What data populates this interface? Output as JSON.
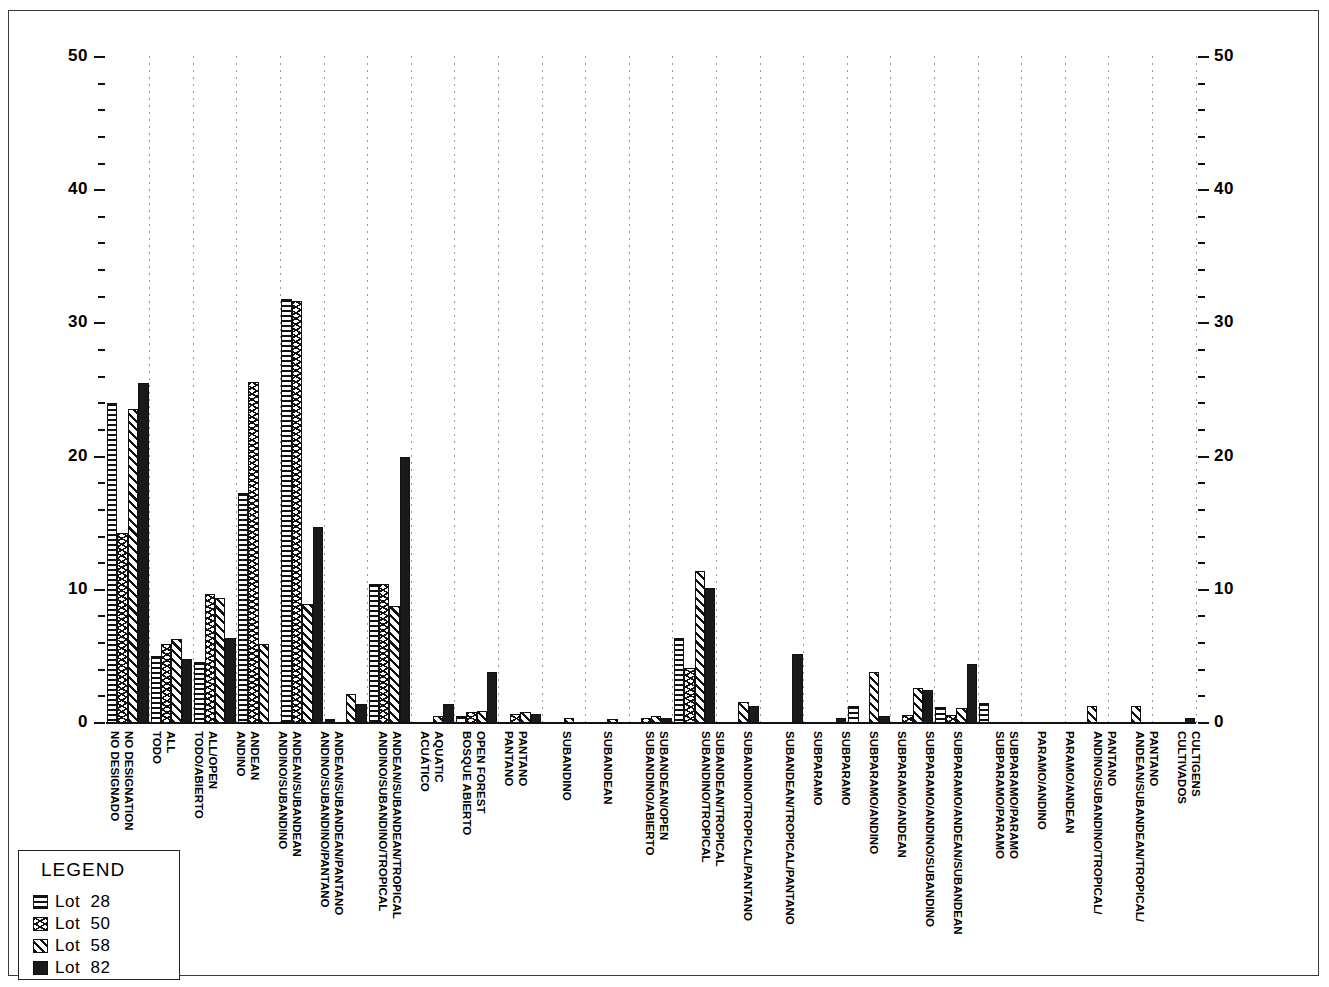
{
  "legend": {
    "title": "LEGEND",
    "entries": [
      {
        "label": "Lot  28",
        "pattern": "horizontal-lines"
      },
      {
        "label": "Lot  50",
        "pattern": "chevron"
      },
      {
        "label": "Lot  58",
        "pattern": "diagonal-lines"
      },
      {
        "label": "Lot  82",
        "pattern": "solid-black"
      }
    ]
  },
  "chart_data": {
    "type": "bar",
    "title": "",
    "xlabel": "",
    "ylabel": "",
    "ylim": [
      0,
      50
    ],
    "y_ticks": [
      0,
      10,
      20,
      30,
      40,
      50
    ],
    "y_minor_step": 2,
    "grid": "dotted-vertical-separators",
    "legend_position": "bottom-left",
    "dual_axis": true,
    "left_axis_ticks": [
      "0",
      "10",
      "20",
      "30",
      "40",
      "50"
    ],
    "right_axis_ticks": [
      "0",
      "10",
      "20",
      "30",
      "40",
      "50"
    ],
    "series": [
      {
        "name": "Lot 28",
        "pattern": "horizontal-lines",
        "values": [
          24,
          5,
          4.6,
          17.3,
          31.8,
          0.3,
          10.4,
          0,
          0.5,
          0,
          0,
          0,
          0,
          6.4,
          0,
          0,
          0,
          1.3,
          0,
          1.2,
          1.5,
          0,
          0,
          0,
          0
        ]
      },
      {
        "name": "Lot 50",
        "pattern": "chevron",
        "values": [
          14.3,
          5.9,
          9.7,
          25.6,
          31.7,
          0,
          10.4,
          0,
          0,
          0.8,
          0,
          0,
          0,
          4.1,
          0,
          0,
          0,
          0,
          0.6,
          2.4,
          1.1,
          0,
          0,
          0,
          0
        ]
      },
      {
        "name": "Lot 58",
        "pattern": "diagonal-lines",
        "values": [
          23.6,
          6.3,
          9.4,
          5.9,
          8.9,
          2.2,
          8.8,
          0,
          0,
          0.8,
          0.5,
          0.3,
          0.4,
          11.4,
          1.6,
          0,
          0,
          3.8,
          2.6,
          1.1,
          1.5,
          1.3,
          1.3,
          0,
          0
        ]
      },
      {
        "name": "Lot 82",
        "pattern": "solid-black",
        "values": [
          25.5,
          4.8,
          6.4,
          0,
          14.7,
          1.4,
          20.0,
          1.4,
          3.8,
          0.7,
          0,
          0,
          0.4,
          10.1,
          1.3,
          5.2,
          0,
          0,
          0.6,
          4.4,
          0,
          0,
          0,
          0,
          0.3
        ]
      }
    ],
    "categories": [
      {
        "english": "NO  DESIGNATION",
        "spanish": "NO  DESIGNADO"
      },
      {
        "english": "ALL",
        "spanish": "TODO"
      },
      {
        "english": "ALL/OPEN",
        "spanish": "TODO/ABIERTO"
      },
      {
        "english": "ANDEAN",
        "spanish": "ANDINO"
      },
      {
        "english": "ANDEAN/SUBANDEAN",
        "spanish": "ANDINO/SUBANDINO"
      },
      {
        "english": "ANDEAN/SUBANDEAN/PANTANO",
        "spanish": "ANDINO/SUBANDINO/PANTANO"
      },
      {
        "english": "ANDEAN/SUBANDEAN/TROPICAL",
        "spanish": "ANDINO/SUBANDINO/TROPICAL"
      },
      {
        "english": "AQUATIC",
        "spanish": "ACUÁTICO"
      },
      {
        "english": "OPEN  FOREST",
        "spanish": "BOSQUE  ABIERTO"
      },
      {
        "english": "PANTANO",
        "spanish": "PANTANO"
      },
      {
        "english": "SUBANDEAN",
        "spanish": "SUBANDINO"
      },
      {
        "english": "SUBANDEAN/OPEN",
        "spanish": "SUBANDINO/ABIERTO"
      },
      {
        "english": "SUBANDEAN/TROPICAL",
        "spanish": "SUBANDINO/TROPICAL"
      },
      {
        "english": "SUBANDEAN/TROPICAL",
        "spanish": "SUBANDINO/TROPICAL"
      },
      {
        "english": "SUBANDEAN/TROPICAL/PANTANO",
        "spanish": "SUBANDINO/TROPICAL/PANTANO"
      },
      {
        "english": "SUBANDEAN/TROPICAL/PANTANO",
        "spanish": "SUBANDINO/TROPICAL/PANTANO"
      },
      {
        "english": "SUBPARAMO",
        "spanish": "SUBPARAMO"
      },
      {
        "english": "SUBPARAMO/ANDEAN",
        "spanish": "SUBPARAMO/ANDINO"
      },
      {
        "english": "SUBPARAMO/ANDEAN",
        "spanish": "SUBPARAMO/ANDINO"
      },
      {
        "english": "SUBPARAMO/ANDEAN/SUBANDEAN",
        "spanish": "SUBPARAMO/ANDINO/SUBANDINO"
      },
      {
        "english": "SUBPARAMO/ANDEAN/SUBANDEAN",
        "spanish": "SUBPARAMO/ANDINO/SUBANDINO"
      },
      {
        "english": "SUBPARAMO/PARAMO",
        "spanish": "SUBPARAMO/PARAMO"
      },
      {
        "english": "PARAMO/ANDEAN",
        "spanish": "PARAMO/ANDINO"
      },
      {
        "english": "ANDEAN/SUBANDEAN/TROPICAL/ PANTANO",
        "spanish": "ANDINO/SUBANDINO/TROPICAL/ PANTANO"
      },
      {
        "english": "CULTIGENS",
        "spanish": "CULTIVADOS"
      }
    ],
    "axis_labels_order": [
      "NO  DESIGNADO",
      "NO  DESIGNATION",
      "TODO",
      "ALL",
      "TODO/ABIERTO",
      "ALL/OPEN",
      "ANDINO",
      "ANDEAN",
      "ANDINO/SUBANDINO",
      "ANDEAN/SUBANDEAN",
      "ANDINO/SUBANDINO/PANTANO",
      "ANDEAN/SUBANDEAN/PANTANO",
      "ANDINO/SUBANDINO/TROPICAL",
      "ANDEAN/SUBANDEAN/TROPICAL",
      "ACUÁTICO",
      "AQUATIC",
      "BOSQUE  ABIERTO",
      "OPEN  FOREST",
      "PANTANO",
      "PANTANO",
      "SUBANDINO",
      "SUBANDEAN",
      "SUBANDINO/ABIERTO",
      "SUBANDEAN/OPEN",
      "SUBANDINO/TROPICAL",
      "SUBANDEAN/TROPICAL",
      "SUBANDINO/TROPICAL/PANTANO",
      "SUBANDEAN/TROPICAL/PANTANO",
      "SUBPARAMO",
      "SUBPARAMO",
      "SUBPARAMO/ANDINO",
      "SUBPARAMO/ANDEAN",
      "SUBPARAMO/ANDINO/SUBANDINO",
      "SUBPARAMO/ANDEAN/SUBANDEAN",
      "SUBPARAMO/PARAMO",
      "SUBPARAMO/PARAMO",
      "PARAMO/ANDINO",
      "PARAMO/ANDEAN",
      "ANDINO/SUBANDINO/TROPICAL/ PANTANO",
      "ANDEAN/SUBANDEAN/TROPICAL/ PANTANO",
      "CULTIVADOS",
      "CULTIGENS"
    ]
  },
  "xaxis": {
    "labels": [
      {
        "text": "NO  DESIGNADO",
        "x": 121,
        "y": 731
      },
      {
        "text": "NO  DESIGNATION",
        "x": 135,
        "y": 731
      },
      {
        "text": "TODO",
        "x": 163,
        "y": 731
      },
      {
        "text": "ALL",
        "x": 177,
        "y": 731
      },
      {
        "text": "TODO/ABIERTO",
        "x": 205,
        "y": 731
      },
      {
        "text": "ALL/OPEN",
        "x": 219,
        "y": 731
      },
      {
        "text": "ANDINO",
        "x": 247,
        "y": 731
      },
      {
        "text": "ANDEAN",
        "x": 261,
        "y": 731
      },
      {
        "text": "ANDINO/SUBANDINO",
        "x": 289,
        "y": 731
      },
      {
        "text": "ANDEAN/SUBANDEAN",
        "x": 303,
        "y": 731
      },
      {
        "text": "ANDINO/SUBANDINO/PANTANO",
        "x": 331,
        "y": 731
      },
      {
        "text": "ANDEAN/SUBANDEAN/PANTANO",
        "x": 345,
        "y": 731
      },
      {
        "text": "ANDINO/SUBANDINO/TROPICAL",
        "x": 389,
        "y": 731
      },
      {
        "text": "ANDEAN/SUBANDEAN/TROPICAL",
        "x": 403,
        "y": 731
      },
      {
        "text": "ACUÁTICO",
        "x": 431,
        "y": 731
      },
      {
        "text": "AQUATIC",
        "x": 445,
        "y": 731
      },
      {
        "text": "BOSQUE  ABIERTO",
        "x": 473,
        "y": 731
      },
      {
        "text": "OPEN  FOREST",
        "x": 487,
        "y": 731
      },
      {
        "text": "PANTANO",
        "x": 515,
        "y": 731
      },
      {
        "text": "PANTANO",
        "x": 529,
        "y": 731
      },
      {
        "text": "SUBANDINO",
        "x": 573,
        "y": 731
      },
      {
        "text": "SUBANDEAN",
        "x": 614,
        "y": 731
      },
      {
        "text": "SUBANDINO/ABIERTO",
        "x": 656,
        "y": 731
      },
      {
        "text": "SUBANDEAN/OPEN",
        "x": 670,
        "y": 731
      },
      {
        "text": "SUBANDINO/TROPICAL",
        "x": 712,
        "y": 731
      },
      {
        "text": "SUBANDEAN/TROPICAL",
        "x": 726,
        "y": 731
      },
      {
        "text": "SUBANDINO/TROPICAL/PANTANO",
        "x": 754,
        "y": 731
      },
      {
        "text": "SUBANDEAN/TROPICAL/PANTANO",
        "x": 796,
        "y": 731
      },
      {
        "text": "SUBPARAMO",
        "x": 824,
        "y": 731
      },
      {
        "text": "SUBPARAMO",
        "x": 852,
        "y": 731
      },
      {
        "text": "SUBPARAMO/ANDINO",
        "x": 880,
        "y": 731
      },
      {
        "text": "SUBPARAMO/ANDEAN",
        "x": 908,
        "y": 731
      },
      {
        "text": "SUBPARAMO/ANDINO/SUBANDINO",
        "x": 936,
        "y": 731
      },
      {
        "text": "SUBPARAMO/ANDEAN/SUBANDEAN",
        "x": 964,
        "y": 731
      },
      {
        "text": "SUBPARAMO/PARAMO",
        "x": 1006,
        "y": 731
      },
      {
        "text": "SUBPARAMO/PARAMO",
        "x": 1020,
        "y": 731
      },
      {
        "text": "PARAMO/ANDINO",
        "x": 1048,
        "y": 731
      },
      {
        "text": "PARAMO/ANDEAN",
        "x": 1076,
        "y": 731
      },
      {
        "text": "ANDINO/SUBANDINO/TROPICAL/",
        "x": 1104,
        "y": 731
      },
      {
        "text": "PANTANO",
        "x": 1118,
        "y": 731
      },
      {
        "text": "ANDEAN/SUBANDEAN/TROPICAL/",
        "x": 1146,
        "y": 731
      },
      {
        "text": "PANTANO",
        "x": 1160,
        "y": 731
      },
      {
        "text": "CULTIVADOS",
        "x": 1188,
        "y": 731
      },
      {
        "text": "CULTIGENS",
        "x": 1202,
        "y": 731
      }
    ]
  },
  "yaxis": {
    "left_labels": [
      {
        "text": "50",
        "v": 50
      },
      {
        "text": "40",
        "v": 40
      },
      {
        "text": "30",
        "v": 30
      },
      {
        "text": "20",
        "v": 20
      },
      {
        "text": "10",
        "v": 10
      },
      {
        "text": "0",
        "v": 0
      }
    ],
    "right_labels": [
      {
        "text": "50",
        "v": 50
      },
      {
        "text": "40",
        "v": 40
      },
      {
        "text": "30",
        "v": 30
      },
      {
        "text": "20",
        "v": 20
      },
      {
        "text": "10",
        "v": 10
      },
      {
        "text": "0",
        "v": 0
      }
    ]
  },
  "bars": [
    {
      "g": 0,
      "s": 0,
      "v": 24.0
    },
    {
      "g": 0,
      "s": 1,
      "v": 14.3
    },
    {
      "g": 0,
      "s": 2,
      "v": 23.6
    },
    {
      "g": 0,
      "s": 3,
      "v": 25.5
    },
    {
      "g": 1,
      "s": 0,
      "v": 5.0
    },
    {
      "g": 1,
      "s": 1,
      "v": 5.9
    },
    {
      "g": 1,
      "s": 2,
      "v": 6.3
    },
    {
      "g": 1,
      "s": 3,
      "v": 4.8
    },
    {
      "g": 2,
      "s": 0,
      "v": 4.6
    },
    {
      "g": 2,
      "s": 1,
      "v": 9.7
    },
    {
      "g": 2,
      "s": 2,
      "v": 9.4
    },
    {
      "g": 2,
      "s": 3,
      "v": 6.4
    },
    {
      "g": 3,
      "s": 0,
      "v": 17.3
    },
    {
      "g": 3,
      "s": 1,
      "v": 25.6
    },
    {
      "g": 3,
      "s": 2,
      "v": 5.9
    },
    {
      "g": 3,
      "s": 3,
      "v": 0
    },
    {
      "g": 4,
      "s": 0,
      "v": 31.8
    },
    {
      "g": 4,
      "s": 1,
      "v": 31.7
    },
    {
      "g": 4,
      "s": 2,
      "v": 8.9
    },
    {
      "g": 4,
      "s": 3,
      "v": 14.7
    },
    {
      "g": 5,
      "s": 0,
      "v": 0.3
    },
    {
      "g": 5,
      "s": 1,
      "v": 0
    },
    {
      "g": 5,
      "s": 2,
      "v": 2.2
    },
    {
      "g": 5,
      "s": 3,
      "v": 1.4
    },
    {
      "g": 6,
      "s": 0,
      "v": 10.4
    },
    {
      "g": 6,
      "s": 1,
      "v": 10.4
    },
    {
      "g": 6,
      "s": 2,
      "v": 8.8
    },
    {
      "g": 6,
      "s": 3,
      "v": 20.0
    },
    {
      "g": 7,
      "s": 0,
      "v": 0
    },
    {
      "g": 7,
      "s": 1,
      "v": 0
    },
    {
      "g": 7,
      "s": 2,
      "v": 0.5
    },
    {
      "g": 7,
      "s": 3,
      "v": 1.4
    },
    {
      "g": 8,
      "s": 0,
      "v": 0.5
    },
    {
      "g": 8,
      "s": 1,
      "v": 0.8
    },
    {
      "g": 8,
      "s": 2,
      "v": 0.9
    },
    {
      "g": 8,
      "s": 3,
      "v": 3.8
    },
    {
      "g": 9,
      "s": 0,
      "v": 0
    },
    {
      "g": 9,
      "s": 1,
      "v": 0.7
    },
    {
      "g": 9,
      "s": 2,
      "v": 0.8
    },
    {
      "g": 9,
      "s": 3,
      "v": 0.7
    },
    {
      "g": 10,
      "s": 0,
      "v": 0
    },
    {
      "g": 10,
      "s": 1,
      "v": 0
    },
    {
      "g": 10,
      "s": 2,
      "v": 0.35
    },
    {
      "g": 10,
      "s": 3,
      "v": 0
    },
    {
      "g": 11,
      "s": 0,
      "v": 0
    },
    {
      "g": 11,
      "s": 1,
      "v": 0
    },
    {
      "g": 11,
      "s": 2,
      "v": 0.3
    },
    {
      "g": 11,
      "s": 3,
      "v": 0
    },
    {
      "g": 12,
      "s": 0,
      "v": 0
    },
    {
      "g": 12,
      "s": 1,
      "v": 0.35
    },
    {
      "g": 12,
      "s": 2,
      "v": 0.5
    },
    {
      "g": 12,
      "s": 3,
      "v": 0.4
    },
    {
      "g": 13,
      "s": 0,
      "v": 6.4
    },
    {
      "g": 13,
      "s": 1,
      "v": 4.1
    },
    {
      "g": 13,
      "s": 2,
      "v": 11.4
    },
    {
      "g": 13,
      "s": 3,
      "v": 10.1
    },
    {
      "g": 14,
      "s": 0,
      "v": 0
    },
    {
      "g": 14,
      "s": 1,
      "v": 0
    },
    {
      "g": 14,
      "s": 2,
      "v": 1.6
    },
    {
      "g": 14,
      "s": 3,
      "v": 1.3
    },
    {
      "g": 15,
      "s": 0,
      "v": 0
    },
    {
      "g": 15,
      "s": 1,
      "v": 0
    },
    {
      "g": 15,
      "s": 2,
      "v": 0
    },
    {
      "g": 15,
      "s": 3,
      "v": 5.2
    },
    {
      "g": 16,
      "s": 0,
      "v": 0
    },
    {
      "g": 16,
      "s": 1,
      "v": 0
    },
    {
      "g": 16,
      "s": 2,
      "v": 0
    },
    {
      "g": 16,
      "s": 3,
      "v": 0.35
    },
    {
      "g": 17,
      "s": 0,
      "v": 1.3
    },
    {
      "g": 17,
      "s": 1,
      "v": 0
    },
    {
      "g": 17,
      "s": 2,
      "v": 3.8
    },
    {
      "g": 17,
      "s": 3,
      "v": 0.5
    },
    {
      "g": 18,
      "s": 0,
      "v": 0
    },
    {
      "g": 18,
      "s": 1,
      "v": 0.6
    },
    {
      "g": 18,
      "s": 2,
      "v": 2.6
    },
    {
      "g": 18,
      "s": 3,
      "v": 2.5
    },
    {
      "g": 19,
      "s": 0,
      "v": 1.2
    },
    {
      "g": 19,
      "s": 1,
      "v": 0.6
    },
    {
      "g": 19,
      "s": 2,
      "v": 1.1
    },
    {
      "g": 19,
      "s": 3,
      "v": 4.4
    },
    {
      "g": 20,
      "s": 0,
      "v": 1.5
    },
    {
      "g": 20,
      "s": 1,
      "v": 0
    },
    {
      "g": 20,
      "s": 2,
      "v": 0
    },
    {
      "g": 20,
      "s": 3,
      "v": 0
    },
    {
      "g": 22,
      "s": 2,
      "v": 1.3
    },
    {
      "g": 23,
      "s": 2,
      "v": 1.3
    },
    {
      "g": 24,
      "s": 3,
      "v": 0.35
    }
  ]
}
